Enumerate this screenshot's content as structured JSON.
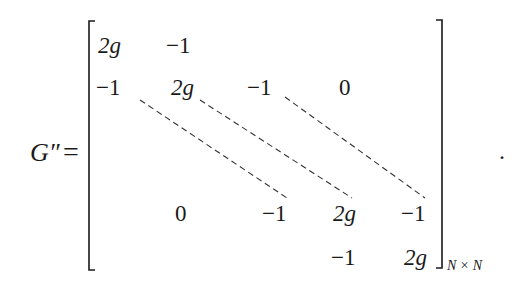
{
  "equation": {
    "lhs": "G″",
    "equals": "=",
    "terminator": ".",
    "subscript": "N × N",
    "matrix": {
      "rows": [
        [
          {
            "v": "2g",
            "x": 98,
            "y": 34
          },
          {
            "v": "−1",
            "x": 166,
            "y": 34
          }
        ],
        [
          {
            "v": "−1",
            "x": 96,
            "y": 76
          },
          {
            "v": "2g",
            "x": 171,
            "y": 76
          },
          {
            "v": "−1",
            "x": 247,
            "y": 76
          },
          {
            "v": "0",
            "x": 339,
            "y": 76
          }
        ],
        [
          {
            "v": "0",
            "x": 175,
            "y": 202
          },
          {
            "v": "−1",
            "x": 262,
            "y": 202
          },
          {
            "v": "2g",
            "x": 333,
            "y": 202
          },
          {
            "v": "−1",
            "x": 401,
            "y": 202
          }
        ],
        [
          {
            "v": "−1",
            "x": 331,
            "y": 246
          },
          {
            "v": "2g",
            "x": 404,
            "y": 246
          }
        ]
      ],
      "dashed_diagonals": [
        {
          "from": [
            140,
            100
          ],
          "to": [
            287,
            198
          ]
        },
        {
          "from": [
            200,
            100
          ],
          "to": [
            352,
            198
          ]
        },
        {
          "from": [
            285,
            97
          ],
          "to": [
            425,
            198
          ]
        }
      ]
    }
  },
  "colors": {
    "ink": "#1a1a1a",
    "background": "#ffffff"
  }
}
